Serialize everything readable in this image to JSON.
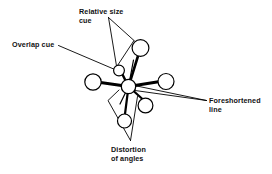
{
  "figure": {
    "title_visible": false,
    "background_color": "#ffffff",
    "ink_color": "#000000"
  },
  "labels": {
    "relative_size": {
      "line1": "Relative size",
      "line2": "cue"
    },
    "overlap": {
      "line1": "Overlap cue"
    },
    "foreshortened": {
      "line1": "Foreshortened",
      "line2": "line"
    },
    "distortion": {
      "line1": "Distortion",
      "line2": "of angles"
    }
  },
  "diagram": {
    "hub": {
      "cx": 128.5,
      "cy": 86.5,
      "r": 7.2
    },
    "nodes": [
      {
        "name": "node-left",
        "cx": 93.0,
        "cy": 82.0,
        "r": 8.2,
        "stroke": 1.1
      },
      {
        "name": "node-right",
        "cx": 166.0,
        "cy": 81.5,
        "r": 8.0,
        "stroke": 1.1
      },
      {
        "name": "node-upper-right",
        "cx": 140.5,
        "cy": 48.0,
        "r": 8.4,
        "stroke": 1.1
      },
      {
        "name": "node-upper-left",
        "cx": 119.0,
        "cy": 70.5,
        "r": 5.4,
        "stroke": 1.1
      },
      {
        "name": "node-lower-right",
        "cx": 145.5,
        "cy": 105.5,
        "r": 7.4,
        "stroke": 1.1
      },
      {
        "name": "node-bottom",
        "cx": 124.5,
        "cy": 121.0,
        "r": 7.0,
        "stroke": 1.1
      }
    ],
    "spokes": [
      {
        "name": "spoke-left",
        "x2": 100.5,
        "y2": 82.5,
        "width": 3.0
      },
      {
        "name": "spoke-right",
        "x2": 158.5,
        "y2": 81.8,
        "width": 3.0
      },
      {
        "name": "spoke-upper-right",
        "x2": 138.0,
        "y2": 56.0,
        "width": 2.6
      },
      {
        "name": "spoke-upper-left",
        "x2": 122.5,
        "y2": 74.0,
        "width": 2.4
      },
      {
        "name": "spoke-lower-right",
        "x2": 143.0,
        "y2": 99.0,
        "width": 2.2
      },
      {
        "name": "spoke-bottom",
        "x2": 125.0,
        "y2": 114.0,
        "width": 2.2
      },
      {
        "name": "spoke-back-upper",
        "x2": 133.5,
        "y2": 60.0,
        "width": 1.2
      },
      {
        "name": "spoke-back-lower",
        "x2": 120.0,
        "y2": 104.0,
        "width": 1.2
      }
    ],
    "foreshortened_lines": [
      {
        "name": "foreshortened-upper",
        "x1": 206.0,
        "y1": 100.0,
        "x2": 129.0,
        "y2": 84.0
      },
      {
        "name": "foreshortened-lower",
        "x1": 206.0,
        "y1": 100.0,
        "x2": 131.0,
        "y2": 89.5
      }
    ]
  }
}
